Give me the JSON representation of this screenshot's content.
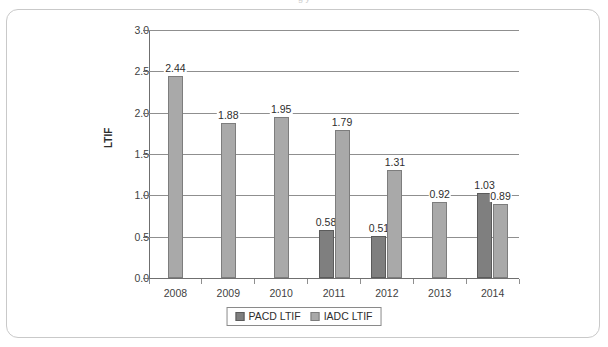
{
  "top_clipped_text": "g   y",
  "chart_data": {
    "type": "bar",
    "title": "",
    "xlabel": "",
    "ylabel": "LTIF",
    "ylim": [
      0.0,
      3.0
    ],
    "ytick_step": 0.5,
    "ytick_labels": [
      "0.0",
      "0.5",
      "1.0",
      "1.5",
      "2.0",
      "2.5",
      "3.0"
    ],
    "ytick_values": [
      0.0,
      0.5,
      1.0,
      1.5,
      2.0,
      2.5,
      3.0
    ],
    "grid": "horizontal",
    "legend_position": "bottom-center",
    "categories": [
      "2008",
      "2009",
      "2010",
      "2011",
      "2012",
      "2013",
      "2014"
    ],
    "series": [
      {
        "name": "PACD LTIF",
        "color": "#7f7f7f",
        "values": [
          null,
          null,
          null,
          0.58,
          0.51,
          null,
          1.03
        ],
        "labels": [
          "",
          "",
          "",
          "0.58",
          "0.51",
          "",
          "1.03"
        ]
      },
      {
        "name": "IADC LTIF",
        "color": "#a9a9a9",
        "values": [
          2.44,
          1.88,
          1.95,
          1.79,
          1.31,
          0.92,
          0.89
        ],
        "labels": [
          "2.44",
          "1.88",
          "1.95",
          "1.79",
          "1.31",
          "0.92",
          "0.89"
        ]
      }
    ]
  },
  "legend": {
    "items": [
      {
        "label": "PACD LTIF",
        "color": "#7f7f7f"
      },
      {
        "label": "IADC LTIF",
        "color": "#a9a9a9"
      }
    ]
  }
}
